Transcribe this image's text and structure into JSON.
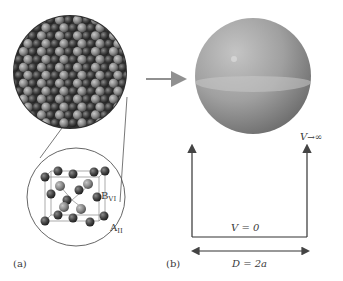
{
  "figure": {
    "panel_a": {
      "label": "(a)",
      "description": "Spherical nanocrystal composed of packed atoms with zoomed-in zinc-blende unit cell",
      "unit_cell_labels": {
        "b_site": "B",
        "b_site_sub": "VI",
        "a_site": "A",
        "a_site_sub": "II"
      }
    },
    "panel_b": {
      "label": "(b)",
      "description": "Sphere modelled as infinite spherical potential well",
      "potential_inside": "V = 0",
      "potential_outside_prefix": "V",
      "potential_outside_value": "∞",
      "diameter_label": "D = 2a"
    },
    "colors": {
      "atom_dark": "#3d3d3d",
      "atom_light": "#8a8a8a",
      "sphere_light": "#b4b4b4",
      "sphere_dark": "#7a7a7a",
      "arrow_gray": "#909090",
      "line": "#444444"
    }
  }
}
